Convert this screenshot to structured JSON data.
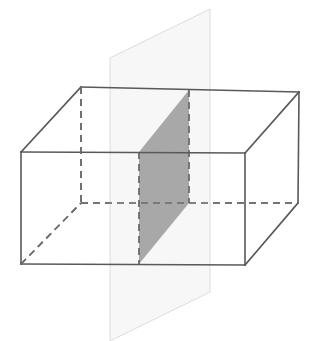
{
  "figure": {
    "canvas": {
      "width": 327,
      "height": 341,
      "background": "#ffffff"
    },
    "colors": {
      "edge_solid": "#595959",
      "edge_hidden": "#6b6b6b",
      "plane_fill": "#f0f0f0",
      "plane_stroke": "#dcdcdc",
      "cross_section_fill": "#a8a8a8",
      "cross_section_stroke": "#6b6b6b",
      "background": "#ffffff"
    },
    "stroke_widths": {
      "edge_solid": 1.6,
      "edge_hidden": 1.6,
      "plane_stroke": 1.0,
      "cross_section_stroke": 1.8
    },
    "dash_pattern": "7,5",
    "box": {
      "label": "cuboid",
      "vertices": {
        "front_top_left": {
          "x": 21,
          "y": 152
        },
        "front_top_right": {
          "x": 245,
          "y": 153
        },
        "front_bottom_left": {
          "x": 21,
          "y": 264
        },
        "front_bottom_right": {
          "x": 245,
          "y": 265
        },
        "back_top_left": {
          "x": 81,
          "y": 87
        },
        "back_top_right": {
          "x": 299,
          "y": 92
        },
        "back_bottom_left": {
          "x": 81,
          "y": 203
        },
        "back_bottom_right": {
          "x": 298,
          "y": 203
        }
      },
      "visible_edges": [
        {
          "name": "front-top-edge",
          "from": "front_top_left",
          "to": "front_top_right"
        },
        {
          "name": "front-bottom-edge",
          "from": "front_bottom_left",
          "to": "front_bottom_right"
        },
        {
          "name": "front-left-edge",
          "from": "front_top_left",
          "to": "front_bottom_left"
        },
        {
          "name": "front-right-edge",
          "from": "front_top_right",
          "to": "front_bottom_right"
        },
        {
          "name": "top-back-edge",
          "from": "back_top_left",
          "to": "back_top_right"
        },
        {
          "name": "top-left-diagonal-edge",
          "from": "front_top_left",
          "to": "back_top_left"
        },
        {
          "name": "top-right-diagonal-edge",
          "from": "front_top_right",
          "to": "back_top_right"
        },
        {
          "name": "back-right-vertical-edge",
          "from": "back_top_right",
          "to": "back_bottom_right"
        },
        {
          "name": "bottom-right-diagonal-edge",
          "from": "front_bottom_right",
          "to": "back_bottom_right"
        }
      ],
      "hidden_edges": [
        {
          "name": "back-left-vertical-hidden-edge",
          "from": "back_top_left",
          "to": "back_bottom_left"
        },
        {
          "name": "bottom-back-hidden-edge",
          "from": "back_bottom_left",
          "to": "back_bottom_right"
        },
        {
          "name": "bottom-left-diagonal-hidden-edge",
          "from": "front_bottom_left",
          "to": "back_bottom_left"
        }
      ]
    },
    "cutting_plane": {
      "label": "vertical cutting plane",
      "shape": "parallelogram",
      "opacity": 0.55,
      "vertices": [
        {
          "name": "plane-top-right",
          "x": 210,
          "y": 9
        },
        {
          "name": "plane-bottom-right",
          "x": 210,
          "y": 292
        },
        {
          "name": "plane-bottom-left",
          "x": 110,
          "y": 341
        },
        {
          "name": "plane-top-left",
          "x": 110,
          "y": 58
        }
      ]
    },
    "cross_section": {
      "label": "shaded cross-section",
      "shape": "parallelogram",
      "vertices": [
        {
          "name": "cs-top-right",
          "x": 189,
          "y": 90
        },
        {
          "name": "cs-bottom-right",
          "x": 189,
          "y": 203
        },
        {
          "name": "cs-bottom-left",
          "x": 139,
          "y": 264
        },
        {
          "name": "cs-top-left",
          "x": 139,
          "y": 152
        }
      ],
      "edges": [
        {
          "name": "cs-right-edge",
          "style": "dashed"
        },
        {
          "name": "cs-bottom-edge",
          "style": "solid-faint"
        },
        {
          "name": "cs-left-edge",
          "style": "dashed"
        },
        {
          "name": "cs-top-edge",
          "style": "solid-faint"
        }
      ]
    }
  }
}
